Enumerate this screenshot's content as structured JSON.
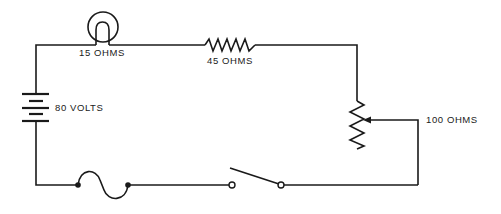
{
  "diagram": {
    "type": "series-circuit",
    "components": [
      {
        "id": "lamp",
        "kind": "lamp",
        "label": "15 OHMS"
      },
      {
        "id": "resistor",
        "kind": "resistor",
        "label": "45 OHMS"
      },
      {
        "id": "battery",
        "kind": "battery",
        "label": "80 VOLTS"
      },
      {
        "id": "rheostat",
        "kind": "variable-resistor",
        "label": "100 OHMS"
      },
      {
        "id": "fuse",
        "kind": "fuse",
        "label": ""
      },
      {
        "id": "switch",
        "kind": "switch",
        "state": "open",
        "label": ""
      }
    ],
    "labels": {
      "lamp": "15 OHMS",
      "resistor": "45 OHMS",
      "battery": "80 VOLTS",
      "rheostat": "100 OHMS"
    },
    "colors": {
      "line": "#1a1a1a",
      "background": "#ffffff"
    }
  }
}
